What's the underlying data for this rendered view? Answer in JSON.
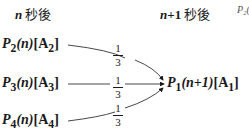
{
  "headers": {
    "left": {
      "var": "n",
      "text": " 秒後"
    },
    "right": {
      "var": "n",
      "op": "+1",
      "text": " 秒後"
    },
    "cutoff": "P₂(i"
  },
  "sources": [
    {
      "p": "P",
      "sub": "2",
      "arg": "(n)",
      "state": "[A",
      "state_sub": "2",
      "close": "]"
    },
    {
      "p": "P",
      "sub": "3",
      "arg": "(n)",
      "state": "[A",
      "state_sub": "3",
      "close": "]"
    },
    {
      "p": "P",
      "sub": "4",
      "arg": "(n)",
      "state": "[A",
      "state_sub": "4",
      "close": "]"
    }
  ],
  "target": {
    "p": "P",
    "sub": "1",
    "arg": "(n+1)",
    "state": "[A",
    "state_sub": "1",
    "close": "]"
  },
  "weights": [
    {
      "num": "1",
      "den": "3"
    },
    {
      "num": "1",
      "den": "3"
    },
    {
      "num": "1",
      "den": "3"
    }
  ],
  "colors": {
    "ink": "#1a1a1a",
    "background": "#ffffff"
  }
}
